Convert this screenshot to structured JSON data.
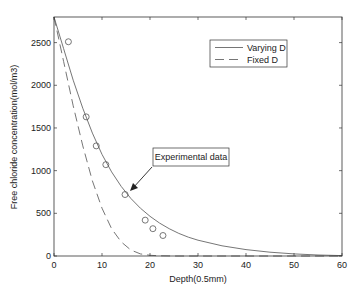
{
  "chart_data": {
    "type": "line",
    "title": "",
    "xlabel": "Depth(0.5mm)",
    "ylabel": "Free chloride concentration(mol/m3)",
    "xlim": [
      0,
      60
    ],
    "ylim": [
      0,
      2800
    ],
    "xticks": [
      0,
      10,
      20,
      30,
      40,
      50,
      60
    ],
    "yticks": [
      0,
      500,
      1000,
      1500,
      2000,
      2500
    ],
    "grid": false,
    "legend_position": "upper right",
    "series": [
      {
        "name": "Varying D",
        "style": "solid",
        "x": [
          0,
          2,
          4,
          6,
          8,
          10,
          12,
          14,
          16,
          18,
          20,
          22,
          24,
          26,
          28,
          30,
          35,
          40,
          45,
          50,
          55,
          60
        ],
        "values": [
          2800,
          2430,
          2060,
          1730,
          1440,
          1190,
          985,
          815,
          675,
          560,
          465,
          385,
          320,
          265,
          220,
          185,
          120,
          75,
          45,
          25,
          12,
          5
        ]
      },
      {
        "name": "Fixed D",
        "style": "dashed",
        "x": [
          0,
          2,
          4,
          6,
          8,
          10,
          12,
          14,
          16,
          18,
          20,
          22,
          25,
          30,
          40,
          50,
          60
        ],
        "values": [
          2800,
          2280,
          1760,
          1290,
          880,
          560,
          320,
          165,
          70,
          25,
          8,
          2,
          0,
          0,
          0,
          0,
          0
        ]
      },
      {
        "name": "Experimental data",
        "style": "markers-circle",
        "x": [
          3,
          6.7,
          8.8,
          10.8,
          14.8,
          19,
          20.6,
          22.7
        ],
        "values": [
          2510,
          1630,
          1290,
          1070,
          720,
          420,
          320,
          240
        ]
      }
    ],
    "annotations": [
      {
        "text": "Experimental data",
        "arrow_to": {
          "x": 15.5,
          "y": 780
        }
      }
    ]
  },
  "legend": {
    "items": [
      {
        "label": "Varying D",
        "style": "solid"
      },
      {
        "label": "Fixed D",
        "style": "dashed"
      }
    ]
  },
  "annotation": {
    "text": "Experimental data"
  }
}
